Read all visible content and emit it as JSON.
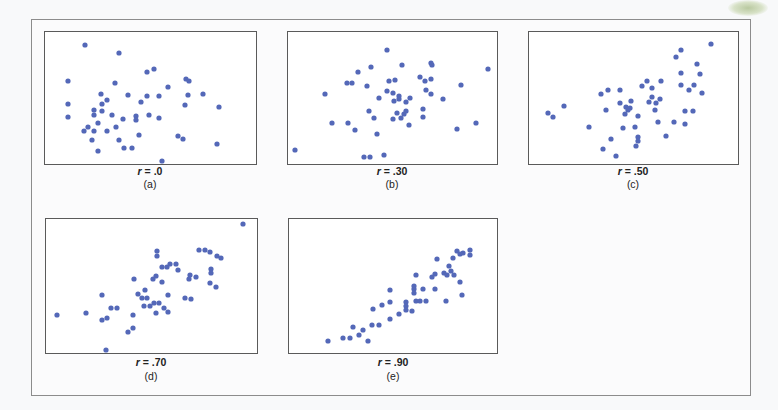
{
  "figure": {
    "panels": [
      {
        "id": "a",
        "r_label": "r = .0",
        "r_symbol": "r",
        "r_value": " = .0",
        "caption": "(a)"
      },
      {
        "id": "b",
        "r_label": "r = .30",
        "r_symbol": "r",
        "r_value": " = .30",
        "caption": "(b)"
      },
      {
        "id": "c",
        "r_label": "r = .50",
        "r_symbol": "r",
        "r_value": " = .50",
        "caption": "(c)"
      },
      {
        "id": "d",
        "r_label": "r = .70",
        "r_symbol": "r",
        "r_value": " = .70",
        "caption": "(d)"
      },
      {
        "id": "e",
        "r_label": "r = .90",
        "r_symbol": "r",
        "r_value": " = .90",
        "caption": "(e)"
      }
    ],
    "dot_color": "#5468b8"
  },
  "chart_data": [
    {
      "type": "scatter",
      "title": "r = .0",
      "caption": "(a)",
      "correlation": 0.0,
      "xlabel": "",
      "ylabel": "",
      "grid": false,
      "points_px": [
        [
          85,
          45
        ],
        [
          119,
          53
        ],
        [
          147,
          72
        ],
        [
          154,
          69
        ],
        [
          68,
          81
        ],
        [
          115,
          83
        ],
        [
          186,
          79
        ],
        [
          189,
          81
        ],
        [
          168,
          87
        ],
        [
          203,
          94
        ],
        [
          101,
          94
        ],
        [
          107,
          100
        ],
        [
          128,
          95
        ],
        [
          147,
          96
        ],
        [
          159,
          96
        ],
        [
          188,
          95
        ],
        [
          68,
          104
        ],
        [
          102,
          104
        ],
        [
          141,
          102
        ],
        [
          185,
          105
        ],
        [
          219,
          107
        ],
        [
          94,
          110
        ],
        [
          102,
          111
        ],
        [
          94,
          115
        ],
        [
          68,
          117
        ],
        [
          112,
          115
        ],
        [
          136,
          116
        ],
        [
          136,
          120
        ],
        [
          149,
          115
        ],
        [
          123,
          119
        ],
        [
          159,
          118
        ],
        [
          98,
          123
        ],
        [
          88,
          127
        ],
        [
          84,
          131
        ],
        [
          94,
          131
        ],
        [
          107,
          131
        ],
        [
          116,
          127
        ],
        [
          139,
          135
        ],
        [
          178,
          136
        ],
        [
          183,
          139
        ],
        [
          92,
          140
        ],
        [
          119,
          140
        ],
        [
          124,
          148
        ],
        [
          132,
          148
        ],
        [
          98,
          151
        ],
        [
          217,
          144
        ],
        [
          162,
          161
        ]
      ]
    },
    {
      "type": "scatter",
      "title": "r = .30",
      "caption": "(b)",
      "correlation": 0.3,
      "xlabel": "",
      "ylabel": "",
      "grid": false,
      "points_px": [
        [
          387,
          50
        ],
        [
          402,
          65
        ],
        [
          431,
          63
        ],
        [
          432,
          65
        ],
        [
          488,
          69
        ],
        [
          358,
          72
        ],
        [
          371,
          67
        ],
        [
          420,
          77
        ],
        [
          425,
          81
        ],
        [
          431,
          79
        ],
        [
          347,
          83
        ],
        [
          352,
          83
        ],
        [
          367,
          86
        ],
        [
          389,
          81
        ],
        [
          395,
          80
        ],
        [
          461,
          85
        ],
        [
          325,
          94
        ],
        [
          387,
          91
        ],
        [
          393,
          93
        ],
        [
          426,
          90
        ],
        [
          431,
          94
        ],
        [
          379,
          98
        ],
        [
          399,
          96
        ],
        [
          399,
          99
        ],
        [
          394,
          101
        ],
        [
          406,
          102
        ],
        [
          410,
          98
        ],
        [
          443,
          99
        ],
        [
          369,
          111
        ],
        [
          397,
          113
        ],
        [
          404,
          114
        ],
        [
          406,
          111
        ],
        [
          423,
          109
        ],
        [
          374,
          118
        ],
        [
          393,
          119
        ],
        [
          401,
          118
        ],
        [
          423,
          117
        ],
        [
          332,
          123
        ],
        [
          348,
          123
        ],
        [
          409,
          125
        ],
        [
          476,
          123
        ],
        [
          355,
          130
        ],
        [
          457,
          129
        ],
        [
          377,
          134
        ],
        [
          295,
          150
        ],
        [
          364,
          157
        ],
        [
          370,
          157
        ],
        [
          384,
          155
        ]
      ]
    },
    {
      "type": "scatter",
      "title": "r = .50",
      "caption": "(c)",
      "correlation": 0.5,
      "xlabel": "",
      "ylabel": "",
      "grid": false,
      "points_px": [
        [
          711,
          44
        ],
        [
          681,
          50
        ],
        [
          676,
          57
        ],
        [
          697,
          64
        ],
        [
          700,
          74
        ],
        [
          681,
          73
        ],
        [
          647,
          81
        ],
        [
          661,
          81
        ],
        [
          642,
          86
        ],
        [
          652,
          88
        ],
        [
          681,
          85
        ],
        [
          694,
          85
        ],
        [
          689,
          90
        ],
        [
          702,
          93
        ],
        [
          601,
          94
        ],
        [
          608,
          90
        ],
        [
          620,
          90
        ],
        [
          652,
          97
        ],
        [
          660,
          99
        ],
        [
          649,
          102
        ],
        [
          656,
          103
        ],
        [
          620,
          103
        ],
        [
          631,
          101
        ],
        [
          626,
          107
        ],
        [
          630,
          108
        ],
        [
          628,
          110
        ],
        [
          625,
          114
        ],
        [
          564,
          106
        ],
        [
          606,
          110
        ],
        [
          655,
          110
        ],
        [
          685,
          111
        ],
        [
          693,
          111
        ],
        [
          548,
          113
        ],
        [
          553,
          117
        ],
        [
          638,
          116
        ],
        [
          658,
          122
        ],
        [
          674,
          122
        ],
        [
          685,
          124
        ],
        [
          589,
          127
        ],
        [
          623,
          128
        ],
        [
          635,
          127
        ],
        [
          666,
          136
        ],
        [
          638,
          137
        ],
        [
          638,
          141
        ],
        [
          636,
          146
        ],
        [
          611,
          139
        ],
        [
          603,
          149
        ],
        [
          616,
          156
        ]
      ]
    },
    {
      "type": "scatter",
      "title": "r = .70",
      "caption": "(d)",
      "correlation": 0.7,
      "xlabel": "",
      "ylabel": "",
      "grid": false,
      "points_px": [
        [
          243,
          224
        ],
        [
          157,
          251
        ],
        [
          157,
          256
        ],
        [
          199,
          250
        ],
        [
          205,
          250
        ],
        [
          210,
          252
        ],
        [
          217,
          256
        ],
        [
          221,
          258
        ],
        [
          162,
          267
        ],
        [
          167,
          267
        ],
        [
          170,
          264
        ],
        [
          176,
          264
        ],
        [
          178,
          270
        ],
        [
          211,
          269
        ],
        [
          211,
          273
        ],
        [
          190,
          275
        ],
        [
          189,
          279
        ],
        [
          196,
          277
        ],
        [
          153,
          279
        ],
        [
          156,
          276
        ],
        [
          162,
          282
        ],
        [
          134,
          279
        ],
        [
          210,
          283
        ],
        [
          216,
          287
        ],
        [
          145,
          290
        ],
        [
          102,
          295
        ],
        [
          138,
          294
        ],
        [
          142,
          298
        ],
        [
          147,
          298
        ],
        [
          168,
          295
        ],
        [
          185,
          298
        ],
        [
          191,
          299
        ],
        [
          154,
          303
        ],
        [
          159,
          303
        ],
        [
          144,
          306
        ],
        [
          150,
          306
        ],
        [
          164,
          308
        ],
        [
          168,
          312
        ],
        [
          156,
          313
        ],
        [
          111,
          308
        ],
        [
          117,
          308
        ],
        [
          57,
          315
        ],
        [
          86,
          313
        ],
        [
          102,
          320
        ],
        [
          107,
          318
        ],
        [
          133,
          315
        ],
        [
          133,
          328
        ],
        [
          128,
          332
        ],
        [
          106,
          350
        ]
      ]
    },
    {
      "type": "scatter",
      "title": "r = .90",
      "caption": "(e)",
      "correlation": 0.9,
      "xlabel": "",
      "ylabel": "",
      "grid": false,
      "points_px": [
        [
          470,
          250
        ],
        [
          470,
          255
        ],
        [
          463,
          253
        ],
        [
          457,
          251
        ],
        [
          460,
          254
        ],
        [
          453,
          258
        ],
        [
          437,
          259
        ],
        [
          449,
          266
        ],
        [
          444,
          273
        ],
        [
          447,
          275
        ],
        [
          451,
          271
        ],
        [
          454,
          275
        ],
        [
          435,
          274
        ],
        [
          432,
          277
        ],
        [
          416,
          275
        ],
        [
          460,
          282
        ],
        [
          462,
          295
        ],
        [
          435,
          289
        ],
        [
          446,
          301
        ],
        [
          423,
          289
        ],
        [
          414,
          286
        ],
        [
          414,
          289
        ],
        [
          414,
          293
        ],
        [
          416,
          301
        ],
        [
          420,
          301
        ],
        [
          426,
          301
        ],
        [
          390,
          290
        ],
        [
          390,
          302
        ],
        [
          406,
          302
        ],
        [
          406,
          306
        ],
        [
          406,
          310
        ],
        [
          412,
          311
        ],
        [
          382,
          305
        ],
        [
          373,
          309
        ],
        [
          399,
          314
        ],
        [
          390,
          319
        ],
        [
          372,
          325
        ],
        [
          379,
          325
        ],
        [
          353,
          327
        ],
        [
          363,
          330
        ],
        [
          359,
          335
        ],
        [
          343,
          338
        ],
        [
          350,
          338
        ],
        [
          368,
          341
        ],
        [
          328,
          341
        ]
      ]
    }
  ]
}
